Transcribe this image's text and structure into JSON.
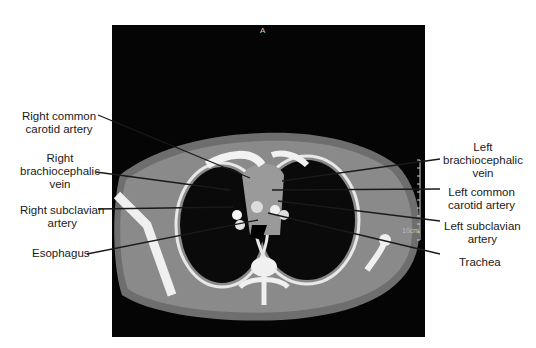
{
  "figure": {
    "orientation_marker": "A",
    "scale_label": "10cm",
    "colors": {
      "background": "#ffffff",
      "scan_background": "#050505",
      "soft_tissue": "#7a7a7a",
      "bone": "#f0f0f0",
      "label_text": "#1a1a1a",
      "leader_line": "#1a1a1a"
    }
  },
  "labels": {
    "left": [
      {
        "id": "right-common-carotid-artery",
        "line1": "Right common",
        "line2": "carotid artery"
      },
      {
        "id": "right-brachiocephalic-vein",
        "line1": "Right",
        "line2": "brachiocephalic",
        "line3": "vein"
      },
      {
        "id": "right-subclavian-artery",
        "line1": "Right subclavian",
        "line2": "artery"
      },
      {
        "id": "esophagus",
        "line1": "Esophagus"
      }
    ],
    "right": [
      {
        "id": "left-brachiocephalic-vein",
        "line1": "Left",
        "line2": "brachiocephalic",
        "line3": "vein"
      },
      {
        "id": "left-common-carotid-artery",
        "line1": "Left common",
        "line2": "carotid artery"
      },
      {
        "id": "left-subclavian-artery",
        "line1": "Left subclavian",
        "line2": "artery"
      },
      {
        "id": "trachea",
        "line1": "Trachea"
      }
    ]
  }
}
